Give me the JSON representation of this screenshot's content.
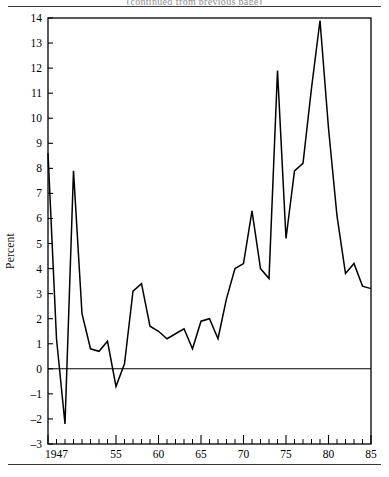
{
  "figure": {
    "clipped_title": "(continued from previous page)",
    "ylabel": "Percent"
  },
  "chart_data": {
    "type": "line",
    "title": "",
    "subtitle": "",
    "xlabel": "",
    "ylabel": "Percent",
    "xlim": [
      1947,
      1985
    ],
    "ylim": [
      -3,
      14
    ],
    "grid": false,
    "legend": null,
    "zero_line": 0,
    "y_ticks": [
      -3,
      -2,
      -1,
      0,
      1,
      2,
      3,
      4,
      5,
      6,
      7,
      8,
      9,
      10,
      11,
      12,
      13,
      14
    ],
    "y_tick_labels": [
      "-3",
      "-2",
      "-1",
      "0",
      "1",
      "2",
      "3",
      "4",
      "5",
      "6",
      "7",
      "8",
      "9",
      "10",
      "11",
      "12",
      "13",
      "14"
    ],
    "x_ticks": [
      1947,
      1948,
      1949,
      1950,
      1951,
      1952,
      1953,
      1954,
      1955,
      1956,
      1957,
      1958,
      1959,
      1960,
      1961,
      1962,
      1963,
      1964,
      1965,
      1966,
      1967,
      1968,
      1969,
      1970,
      1971,
      1972,
      1973,
      1974,
      1975,
      1976,
      1977,
      1978,
      1979,
      1980,
      1981,
      1982,
      1983,
      1984,
      1985
    ],
    "x_tick_labels": [
      "1947",
      "",
      "",
      "",
      "",
      "",
      "",
      "",
      "55",
      "",
      "",
      "",
      "",
      "60",
      "",
      "",
      "",
      "",
      "65",
      "",
      "",
      "",
      "",
      "70",
      "",
      "",
      "",
      "",
      "75",
      "",
      "",
      "",
      "",
      "80",
      "",
      "",
      "",
      "",
      "85"
    ],
    "x_major_ticks": [
      1947,
      1955,
      1960,
      1965,
      1970,
      1975,
      1980,
      1985
    ],
    "series": [
      {
        "name": "Percent",
        "x": [
          1947,
          1948,
          1949,
          1950,
          1951,
          1952,
          1953,
          1954,
          1955,
          1956,
          1957,
          1958,
          1959,
          1960,
          1961,
          1962,
          1963,
          1964,
          1965,
          1966,
          1967,
          1968,
          1969,
          1970,
          1971,
          1972,
          1973,
          1974,
          1975,
          1976,
          1977,
          1978,
          1979,
          1980,
          1981,
          1982,
          1983,
          1984,
          1985
        ],
        "values": [
          8.6,
          1.2,
          -2.2,
          7.9,
          2.2,
          0.8,
          0.7,
          1.1,
          -0.7,
          0.2,
          3.1,
          3.4,
          1.7,
          1.5,
          1.2,
          1.4,
          1.6,
          0.8,
          1.9,
          2.0,
          1.2,
          2.8,
          4.0,
          4.2,
          6.3,
          4.0,
          3.6,
          11.9,
          5.2,
          7.9,
          8.2,
          11.2,
          13.9,
          9.6,
          6.1,
          3.8,
          4.2,
          3.3,
          3.2
        ]
      }
    ]
  }
}
